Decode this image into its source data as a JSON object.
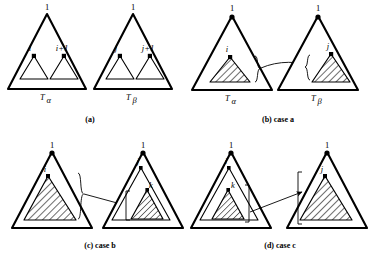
{
  "figure": {
    "title": "",
    "panels": [
      {
        "id": "panel-a",
        "caption": "(a)",
        "caption_main": "(a)",
        "caption_case": "",
        "left": {
          "tree_label": "T",
          "tree_sub": "α",
          "root_label": "1",
          "node_labels": [
            "i",
            "i+1"
          ],
          "hatched": false
        },
        "right": {
          "tree_label": "T",
          "tree_sub": "β",
          "root_label": "1",
          "node_labels": [
            "j",
            "j+1"
          ],
          "hatched": false
        }
      },
      {
        "id": "panel-b",
        "caption": "(b) case a",
        "caption_main": "(b)",
        "caption_case": "case a",
        "left": {
          "tree_label": "T",
          "tree_sub": "α",
          "root_label": "1",
          "node_labels": [
            "i"
          ],
          "hatched": true
        },
        "right": {
          "tree_label": "T",
          "tree_sub": "β",
          "root_label": "1",
          "node_labels": [
            "j"
          ],
          "hatched": true
        }
      },
      {
        "id": "panel-c",
        "caption": "(c) case b",
        "caption_main": "(c)",
        "caption_case": "case b",
        "left": {
          "tree_label": "",
          "tree_sub": "",
          "root_label": "1",
          "node_labels": [
            "i"
          ],
          "hatched": true
        },
        "right": {
          "tree_label": "",
          "tree_sub": "",
          "root_label": "1",
          "node_labels": [
            "j",
            "k"
          ],
          "hatched": true
        }
      },
      {
        "id": "panel-d",
        "caption": "(d) case c",
        "caption_main": "(d)",
        "caption_case": "case c",
        "left": {
          "tree_label": "",
          "tree_sub": "",
          "root_label": "1",
          "node_labels": [
            "i",
            "k"
          ],
          "hatched": true
        },
        "right": {
          "tree_label": "",
          "tree_sub": "",
          "root_label": "1",
          "node_labels": [
            "j"
          ],
          "hatched": true
        }
      }
    ],
    "colors": {
      "ink": "#000000",
      "paper": "#ffffff"
    },
    "symbols": {
      "brace": "}",
      "brace_left": "{",
      "arrow": "→"
    }
  }
}
